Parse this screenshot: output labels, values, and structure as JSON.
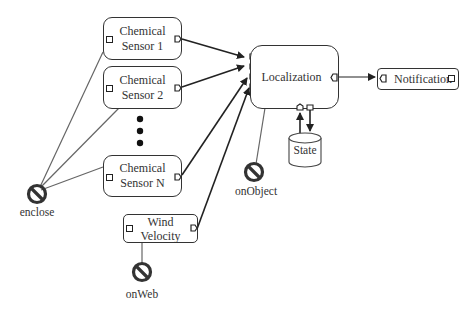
{
  "diagram": {
    "type": "component-flow",
    "nodes": {
      "sensor1": {
        "line1": "Chemical",
        "line2": "Sensor 1"
      },
      "sensor2": {
        "line1": "Chemical",
        "line2": "Sensor 2"
      },
      "sensorN": {
        "line1": "Chemical",
        "line2": "Sensor N"
      },
      "wind": {
        "line1": "Wind",
        "line2": "Velocity"
      },
      "localization": {
        "label": "Localization"
      },
      "notification": {
        "label": "Notification"
      },
      "state": {
        "label": "State"
      }
    },
    "constraints": {
      "enclose": {
        "label": "enclose"
      },
      "onObject": {
        "label": "onObject"
      },
      "onWeb": {
        "label": "onWeb"
      }
    },
    "ellipsis": "vertical-dots",
    "edges": [
      {
        "from": "Chemical Sensor 1",
        "to": "Localization",
        "style": "arrow"
      },
      {
        "from": "Chemical Sensor 2",
        "to": "Localization",
        "style": "arrow"
      },
      {
        "from": "Chemical Sensor N",
        "to": "Localization",
        "style": "arrow"
      },
      {
        "from": "Wind Velocity",
        "to": "Localization",
        "style": "arrow"
      },
      {
        "from": "Localization",
        "to": "Notification",
        "style": "arrow"
      },
      {
        "from": "State",
        "to": "Localization",
        "style": "arrow"
      },
      {
        "from": "Localization",
        "to": "State",
        "style": "arrow"
      },
      {
        "from": "enclose",
        "to": "Chemical Sensor 1",
        "style": "line"
      },
      {
        "from": "enclose",
        "to": "Chemical Sensor 2",
        "style": "line"
      },
      {
        "from": "enclose",
        "to": "Chemical Sensor N",
        "style": "line"
      },
      {
        "from": "onObject",
        "to": "Localization",
        "style": "line"
      },
      {
        "from": "onWeb",
        "to": "Wind Velocity",
        "style": "line"
      }
    ]
  }
}
